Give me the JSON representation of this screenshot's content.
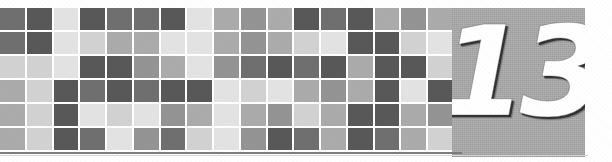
{
  "page": {
    "kind": "book-chapter-opener-banner",
    "width": 612,
    "height": 162,
    "background_color": "#ffffff"
  },
  "chapter": {
    "number": "13",
    "number_color": "#ffffff",
    "plate_color": "#adadad",
    "plate_shadow_color": "#2d2d2d"
  },
  "rule": {
    "color": "#7d7d7d",
    "fade_color": "#d7d7d7"
  },
  "mosaic": {
    "columns": 17,
    "rows": 6,
    "gutter_color": "#ffffff",
    "palette": {
      "light": "#e3e3e3",
      "pale": "#d2d2d2",
      "mid": "#ababab",
      "midlow": "#949494",
      "dark": "#6f6f6f",
      "darker": "#585858"
    },
    "tiles": [
      [
        "dark",
        "darker",
        "light",
        "darker",
        "dark",
        "dark",
        "darker",
        "light",
        "mid",
        "midlow",
        "mid",
        "darker",
        "dark",
        "darker",
        "mid",
        "midlow",
        "mid"
      ],
      [
        "dark",
        "darker",
        "light",
        "pale",
        "mid",
        "mid",
        "light",
        "light",
        "mid",
        "midlow",
        "mid",
        "pale",
        "light",
        "darker",
        "darker",
        "pale",
        "light"
      ],
      [
        "pale",
        "pale",
        "light",
        "darker",
        "darker",
        "midlow",
        "mid",
        "light",
        "midlow",
        "dark",
        "darker",
        "dark",
        "darker",
        "mid",
        "darker",
        "darker",
        "pale"
      ],
      [
        "mid",
        "pale",
        "darker",
        "dark",
        "darker",
        "dark",
        "darker",
        "darker",
        "light",
        "pale",
        "light",
        "mid",
        "midlow",
        "mid",
        "darker",
        "light",
        "darker"
      ],
      [
        "mid",
        "pale",
        "darker",
        "light",
        "pale",
        "light",
        "midlow",
        "mid",
        "light",
        "mid",
        "midlow",
        "pale",
        "mid",
        "darker",
        "darker",
        "mid",
        "midlow"
      ],
      [
        "mid",
        "pale",
        "darker",
        "dark",
        "light",
        "midlow",
        "dark",
        "pale",
        "light",
        "midlow",
        "darker",
        "dark",
        "mid",
        "darker",
        "dark",
        "mid",
        "pale"
      ]
    ]
  }
}
